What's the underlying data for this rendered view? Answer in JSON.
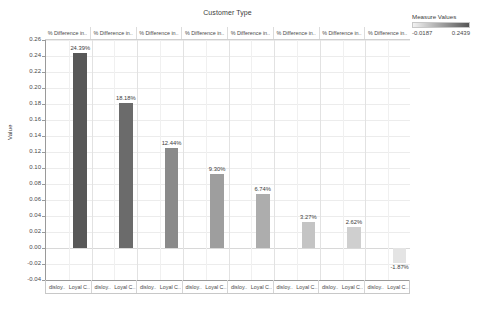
{
  "chart_data": {
    "type": "bar",
    "title": "Customer Type",
    "xlabel": "",
    "ylabel": "Value",
    "ylim": [
      -0.04,
      0.26
    ],
    "ytick_step": 0.02,
    "yticks": [
      "0.26",
      "0.24",
      "0.22",
      "0.20",
      "0.18",
      "0.16",
      "0.14",
      "0.12",
      "0.10",
      "0.08",
      "0.06",
      "0.04",
      "0.02",
      "0.00",
      "-0.02",
      "-0.04"
    ],
    "grid": true,
    "legend_position": "top-right",
    "panel_headers": [
      "% Difference in..",
      "% Difference in..",
      "% Difference in..",
      "% Difference in..",
      "% Difference in..",
      "% Difference in..",
      "% Difference in..",
      "% Difference in.."
    ],
    "x_subcategories": [
      "disloy..",
      "Loyal C.."
    ],
    "categories": [
      "Loyal C..",
      "Loyal C..",
      "Loyal C..",
      "Loyal C..",
      "Loyal C..",
      "Loyal C..",
      "Loyal C..",
      "Loyal C.."
    ],
    "values": [
      0.2439,
      0.1818,
      0.1244,
      0.093,
      0.0674,
      0.0327,
      0.0262,
      -0.0187
    ],
    "data_labels": [
      "24.39%",
      "18.18%",
      "12.44%",
      "9.30%",
      "6.74%",
      "3.27%",
      "2.62%",
      "-1.87%"
    ],
    "bar_colors": [
      "#575757",
      "#6b6b6b",
      "#8a8a8a",
      "#9e9e9e",
      "#adadad",
      "#c4c4c4",
      "#cfcfcf",
      "#e4e4e4"
    ]
  },
  "legend": {
    "title": "Measure Values",
    "min": "-0.0187",
    "max": "0.2439",
    "gradient_from": "#f2f2f2",
    "gradient_to": "#555555"
  }
}
